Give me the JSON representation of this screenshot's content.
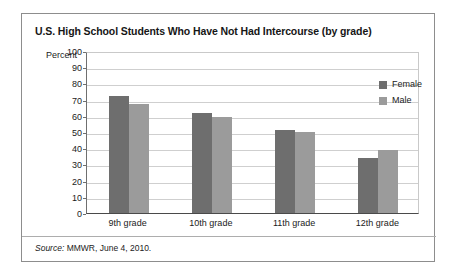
{
  "figure": {
    "title": "U.S. High School Students Who Have Not Had Intercourse (by grade)",
    "source_prefix": "Source:",
    "source_text": " MMWR, June 4, 2010."
  },
  "colors": {
    "female_bar": "#6e6e6e",
    "male_bar": "#9b9b9b",
    "frame_border": "#8d8d8d",
    "gridline": "#cfcfcf",
    "axis": "#4a4a4a",
    "text": "#1b1b1b"
  },
  "chart_data": {
    "type": "bar",
    "title": "U.S. High School Students Who Have Not Had Intercourse (by grade)",
    "xlabel": "",
    "ylabel": "Percent",
    "ylim": [
      0,
      100
    ],
    "ytick_step": 10,
    "yticks": [
      100,
      90,
      80,
      70,
      60,
      50,
      40,
      30,
      20,
      10,
      0
    ],
    "grid": true,
    "legend_position": "top-right inside plot",
    "categories": [
      "9th grade",
      "10th grade",
      "11th grade",
      "12th grade"
    ],
    "series": [
      {
        "name": "Female",
        "color": "#6e6e6e",
        "values": [
          72,
          62,
          51,
          34
        ]
      },
      {
        "name": "Male",
        "color": "#9b9b9b",
        "values": [
          67,
          59,
          50,
          39
        ]
      }
    ]
  }
}
